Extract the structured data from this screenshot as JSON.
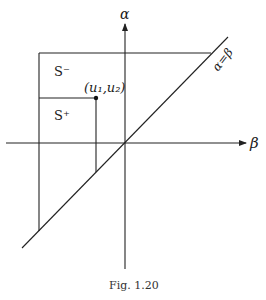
{
  "figure": {
    "caption": "Fig. 1.20",
    "axes": {
      "vertical_label": "α",
      "horizontal_label": "β"
    },
    "diagonal_label": "α=β",
    "regions": {
      "s_minus": "S⁻",
      "s_plus": "S⁺"
    },
    "point_label": "(u₁,u₂)",
    "line_color": "#222222"
  }
}
